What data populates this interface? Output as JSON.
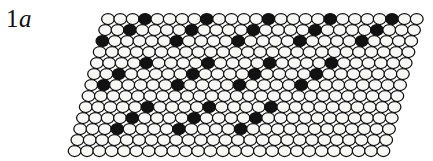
{
  "figure": {
    "panel_label_number": "1",
    "panel_label_letter": "a",
    "panel_label_full": "1a",
    "background_color": "#ffffff",
    "width": 433,
    "height": 161
  },
  "lattice": {
    "description": "sheared close-packed hexagonal monolayer of circles with black superlattice sites",
    "circle_fill_open": "#f7f7f5",
    "circle_fill_filled": "#121212",
    "circle_stroke": "#111111",
    "circle_stroke_width": 1.25,
    "circle_radius_x": 6.4,
    "circle_radius_y": 5.5,
    "column_spacing": 12.35,
    "row_spacing": 11.0,
    "row_shear_dx": -2.78,
    "row_offset_stagger": 6.18,
    "origin_x": 108.0,
    "origin_y": 19.0,
    "rows": 13,
    "columns": 26,
    "superlattice": {
      "period_columns": 5.2,
      "period_rows": 4,
      "row_shift_columns": 1.35,
      "filled_count": 26
    },
    "filled_sites": [
      {
        "row": 0,
        "col": 3
      },
      {
        "row": 0,
        "col": 8
      },
      {
        "row": 0,
        "col": 13
      },
      {
        "row": 0,
        "col": 18
      },
      {
        "row": 0,
        "col": 23
      },
      {
        "row": 1,
        "col": 2
      },
      {
        "row": 1,
        "col": 7
      },
      {
        "row": 1,
        "col": 12
      },
      {
        "row": 1,
        "col": 17
      },
      {
        "row": 1,
        "col": 22
      },
      {
        "row": 2,
        "col": 0
      },
      {
        "row": 2,
        "col": 6
      },
      {
        "row": 2,
        "col": 11
      },
      {
        "row": 2,
        "col": 16
      },
      {
        "row": 2,
        "col": 21
      },
      {
        "row": 4,
        "col": 4
      },
      {
        "row": 4,
        "col": 9
      },
      {
        "row": 4,
        "col": 14
      },
      {
        "row": 4,
        "col": 19
      },
      {
        "row": 5,
        "col": 2
      },
      {
        "row": 5,
        "col": 8
      },
      {
        "row": 5,
        "col": 13
      },
      {
        "row": 5,
        "col": 18
      },
      {
        "row": 6,
        "col": 1
      },
      {
        "row": 6,
        "col": 7
      },
      {
        "row": 6,
        "col": 12
      },
      {
        "row": 6,
        "col": 17
      },
      {
        "row": 8,
        "col": 5
      },
      {
        "row": 8,
        "col": 10
      },
      {
        "row": 8,
        "col": 15
      },
      {
        "row": 9,
        "col": 4
      },
      {
        "row": 9,
        "col": 9
      },
      {
        "row": 9,
        "col": 14
      },
      {
        "row": 10,
        "col": 3
      },
      {
        "row": 10,
        "col": 8
      },
      {
        "row": 10,
        "col": 13
      }
    ]
  }
}
